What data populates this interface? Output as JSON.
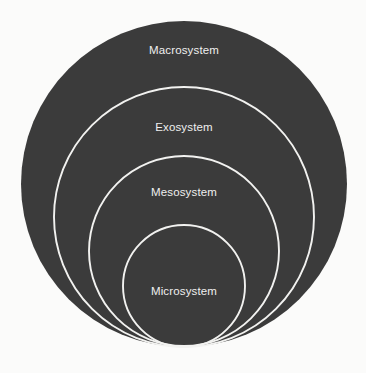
{
  "diagram": {
    "type": "nested-circles",
    "background_color": "#fbfbfa",
    "fill_color": "#3b3b3b",
    "stroke_color": "#f2f2f0",
    "label_color": "#efefef",
    "stroke_width": 1.9,
    "canvas": {
      "width": 366,
      "height": 373
    },
    "rings": [
      {
        "key": "macrosystem",
        "label": "Macrosystem",
        "level": 1,
        "cx": 184,
        "cy": 184,
        "r": 163,
        "label_x": 184,
        "label_y": 51
      },
      {
        "key": "exosystem",
        "label": "Exosystem",
        "level": 2,
        "cx": 184,
        "cy": 217,
        "r": 130,
        "label_x": 184,
        "label_y": 128
      },
      {
        "key": "mesosystem",
        "label": "Mesosystem",
        "level": 3,
        "cx": 184,
        "cy": 251,
        "r": 95,
        "label_x": 184,
        "label_y": 193
      },
      {
        "key": "microsystem",
        "label": "Microsystem",
        "level": 4,
        "cx": 184,
        "cy": 286,
        "r": 61,
        "label_x": 184,
        "label_y": 292
      }
    ]
  }
}
